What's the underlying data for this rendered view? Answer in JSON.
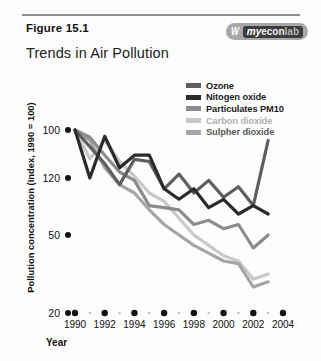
{
  "header": {
    "figure_label": "Figure 15.1",
    "title": "Trends in Air Pollution",
    "logo": {
      "mark": "W",
      "part1": "my",
      "part2": "econ",
      "part3": "lab"
    }
  },
  "axes": {
    "ylabel": "Pollution concentration (Index, 1990 = 100)",
    "xlabel": "Year",
    "yticks": [
      "120",
      "100",
      "50",
      "20"
    ],
    "xticks": [
      "1990",
      "1992",
      "1994",
      "1996",
      "1998",
      "2000",
      "2002",
      "2004"
    ]
  },
  "legend": [
    {
      "label": "Ozone",
      "color": "#5e5e5e"
    },
    {
      "label": "Nitogen oxide",
      "color": "#2b2b2b"
    },
    {
      "label": "Particulates PM10",
      "color": "#8c8c8c"
    },
    {
      "label": "Carbon dioxide",
      "color": "#c9c9c9"
    },
    {
      "label": "Sulpher dioxide",
      "color": "#a5a5a5"
    }
  ],
  "chart_data": {
    "type": "line",
    "title": "Trends in Air Pollution",
    "xlabel": "Year",
    "ylabel": "Pollution concentration (Index, 1990 = 100)",
    "xlim": [
      1990,
      2004
    ],
    "ylim": [
      20,
      125
    ],
    "grid": false,
    "legend_position": "top-right",
    "x": [
      1990,
      1991,
      1992,
      1993,
      1994,
      1995,
      1996,
      1997,
      1998,
      1999,
      2000,
      2001,
      2002,
      2003
    ],
    "series": [
      {
        "name": "Ozone",
        "color": "#5e5e5e",
        "values": [
          100,
          92,
          84,
          74,
          86,
          85,
          72,
          79,
          70,
          76,
          68,
          73,
          64,
          95
        ]
      },
      {
        "name": "Nitogen oxide",
        "color": "#2b2b2b",
        "values": [
          100,
          120,
          97,
          82,
          88,
          88,
          72,
          67,
          72,
          63,
          67,
          60,
          64,
          60
        ]
      },
      {
        "name": "Particulates PM10",
        "color": "#8c8c8c",
        "values": [
          100,
          103,
          88,
          80,
          76,
          64,
          63,
          62,
          55,
          57,
          53,
          55,
          45,
          50
        ]
      },
      {
        "name": "Carbon dioxide",
        "color": "#c9c9c9",
        "values": [
          100,
          112,
          95,
          85,
          78,
          70,
          66,
          58,
          50,
          46,
          42,
          40,
          33,
          35
        ]
      },
      {
        "name": "Sulpher dioxide",
        "color": "#a5a5a5",
        "values": [
          100,
          95,
          82,
          74,
          70,
          62,
          55,
          50,
          46,
          43,
          40,
          39,
          30,
          32
        ]
      }
    ]
  }
}
